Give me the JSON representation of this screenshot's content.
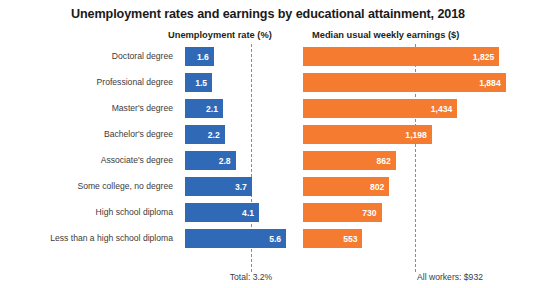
{
  "chart_data": {
    "type": "bar",
    "title": "Unemployment rates and earnings by educational attainment, 2018",
    "orientation": "horizontal",
    "grid": false,
    "legend_position": "top-column-headers",
    "categories": [
      "Doctoral degree",
      "Professional degree",
      "Master's degree",
      "Bachelor's degree",
      "Associate's degree",
      "Some college, no degree",
      "High school diploma",
      "Less than a high school diploma"
    ],
    "series": [
      {
        "name": "Unemployment rate (%)",
        "color": "#3069b5",
        "xlabel": "Unemployment rate (%)",
        "xlim": [
          0,
          6.2
        ],
        "values": [
          1.6,
          1.5,
          2.1,
          2.2,
          2.8,
          3.7,
          4.1,
          5.6
        ],
        "value_labels": [
          "1.6",
          "1.5",
          "2.1",
          "2.2",
          "2.8",
          "3.7",
          "4.1",
          "5.6"
        ],
        "reference_line": {
          "value": 3.2,
          "label": "Total: 3.2%"
        }
      },
      {
        "name": "Median usual weekly earnings ($)",
        "color": "#f47b30",
        "xlabel": "Median usual weekly earnings ($)",
        "xlim": [
          0,
          1980
        ],
        "values": [
          1825,
          1884,
          1434,
          1198,
          862,
          802,
          730,
          553
        ],
        "value_labels": [
          "1,825",
          "1,884",
          "1,434",
          "1,198",
          "862",
          "802",
          "730",
          "553"
        ],
        "reference_line": {
          "value": 932,
          "label": "All workers: $932"
        }
      }
    ]
  },
  "header": {
    "title": "Unemployment rates and earnings by educational attainment, 2018",
    "subtitle_unemployment": "Unemployment rate (%)",
    "subtitle_earnings": "Median usual weekly earnings ($)"
  },
  "footer": {
    "total_rate": "Total: 3.2%",
    "all_workers_earnings": "All workers: $932"
  },
  "colors": {
    "unemployment_bar": "#3069b5",
    "earnings_bar": "#f47b30",
    "reference_line": "#8c8c8c",
    "text": "#231f20"
  }
}
